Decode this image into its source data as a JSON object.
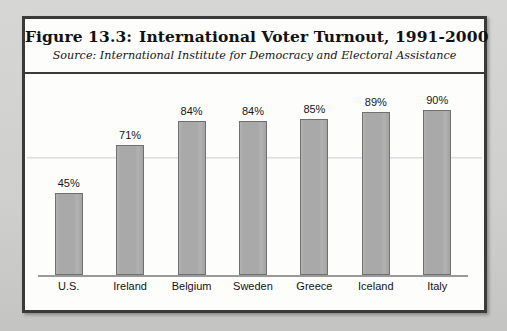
{
  "figure": {
    "number_label": "Figure 13.3:",
    "title": "International Voter Turnout, 1991-2000",
    "source": "Source: International Institute for Democracy and Electoral Assistance"
  },
  "colors": {
    "bar_fill": "#a9a9a9",
    "bar_border": "#707070",
    "frame": "#3a3a3a",
    "axis": "#9a9a9a",
    "paper": "#fdfdfc",
    "page_background": "#cfcfcd"
  },
  "chart_data": {
    "type": "bar",
    "subtitle": "Source: International Institute for Democracy and Electoral Assistance",
    "categories": [
      "U.S.",
      "Ireland",
      "Belgium",
      "Sweden",
      "Greece",
      "Iceland",
      "Italy"
    ],
    "values": [
      45,
      71,
      84,
      84,
      85,
      89,
      90
    ],
    "value_labels": [
      "45%",
      "71%",
      "84%",
      "84%",
      "85%",
      "89%",
      "90%"
    ],
    "xlabel": "",
    "ylabel": "",
    "ylim": [
      0,
      100
    ],
    "grid": false,
    "legend": false,
    "axis_visible": {
      "x": true,
      "y": false
    },
    "tick_labels": {
      "y": []
    }
  }
}
